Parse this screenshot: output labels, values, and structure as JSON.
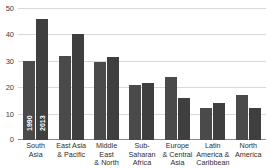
{
  "chart_data": {
    "type": "bar",
    "title": "",
    "xlabel": "",
    "ylabel": "",
    "ylim": [
      0,
      50
    ],
    "yticks": [
      0,
      10,
      20,
      30,
      40,
      50
    ],
    "ytick_labels": [
      "0",
      "10",
      "20",
      "30",
      "40",
      "50"
    ],
    "grid": true,
    "legend": "in-bar",
    "categories": [
      "South Asia",
      "East Asia & Pacific",
      "Middle East & North Africa",
      "Sub-Saharan Africa",
      "Europe & Central Asia",
      "Latin America & Caribbean",
      "North America"
    ],
    "category_lines": [
      [
        "South",
        "Asia"
      ],
      [
        "East Asia",
        "& Pacific"
      ],
      [
        "Middle East",
        "& North",
        "Africa"
      ],
      [
        "Sub-Saharan",
        "Africa"
      ],
      [
        "Europe",
        "& Central",
        "Asia"
      ],
      [
        "Latin",
        "America &",
        "Caribbean"
      ],
      [
        "North",
        "America"
      ]
    ],
    "series": [
      {
        "name": "1990",
        "color": "#4a4a4a",
        "values": [
          30,
          32,
          29.5,
          21,
          24,
          12,
          17
        ]
      },
      {
        "name": "2013",
        "color": "#3f3f3f",
        "values": [
          46,
          40,
          31.5,
          21.5,
          16,
          14,
          12
        ]
      }
    ]
  },
  "colors": {
    "series_1990": "#4a4a4a",
    "series_2013": "#3f3f3f",
    "gridline": "#d9d9d9",
    "axis": "#8a8a8a",
    "text": "#2e2e2e",
    "background": "#ffffff"
  }
}
